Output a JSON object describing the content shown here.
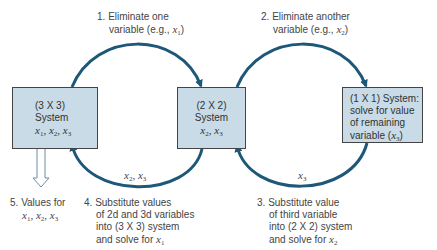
{
  "diagram": {
    "colors": {
      "box_fill": "#c8dbe6",
      "arrow": "#1d5878",
      "text": "#444444"
    },
    "nodes": [
      {
        "id": "sys3",
        "lines": [
          "(3 X 3)",
          "System"
        ],
        "vars": "x1, x2, x3"
      },
      {
        "id": "sys2",
        "lines": [
          "(2 X 2)",
          "System"
        ],
        "vars": "x2, x3"
      },
      {
        "id": "sys1",
        "lines": [
          "(1 X 1) System:",
          "solve for value",
          "of remaining",
          "variable (x3)"
        ]
      }
    ],
    "steps": [
      {
        "number": "1.",
        "lines": [
          "Eliminate one",
          "variable (e.g., x1)"
        ],
        "from": "sys3",
        "to": "sys2"
      },
      {
        "number": "2.",
        "lines": [
          "Eliminate another",
          "variable (e.g., x2)"
        ],
        "from": "sys2",
        "to": "sys1"
      },
      {
        "number": "3.",
        "lines": [
          "Substitute value",
          "of third variable",
          "into (2 X 2) system",
          "and solve for x2"
        ],
        "from": "sys1",
        "to": "sys2",
        "carried": "x3"
      },
      {
        "number": "4.",
        "lines": [
          "Substitute values",
          "of 2d and 3d variables",
          "into (3 X 3) system",
          "and solve for x1"
        ],
        "from": "sys2",
        "to": "sys3",
        "carried": "x2, x3"
      },
      {
        "number": "5.",
        "lines": [
          "Values for",
          "x1, x2, x3"
        ],
        "from": "sys3",
        "to": "output"
      }
    ]
  },
  "text": {
    "box1_l1": "(3 X 3)",
    "box1_l2": "System",
    "box2_l1": "(2 X 2)",
    "box2_l2": "System",
    "box3_l1": "(1 X 1) System:",
    "box3_l2": "solve for value",
    "box3_l3": "of remaining",
    "box3_l4": "variable (",
    "step1_num": "1.",
    "step1_l1": "Eliminate one",
    "step1_l2": "variable (e.g., ",
    "step2_num": "2.",
    "step2_l1": "Eliminate another",
    "step2_l2": "variable (e.g., ",
    "step3_num": "3.",
    "step3_l1": "Substitute value",
    "step3_l2": "of third variable",
    "step3_l3": "into (2 X 2) system",
    "step3_l4": "and solve for ",
    "step4_num": "4.",
    "step4_l1": "Substitute values",
    "step4_l2": "of 2d and 3d variables",
    "step4_l3": "into (3 X 3) system",
    "step4_l4": "and solve for ",
    "step5_num": "5.",
    "step5_l1": "Values for",
    "x": "x",
    "comma": ", ",
    "close_paren": ")",
    "s1": "1",
    "s2": "2",
    "s3": "3"
  }
}
